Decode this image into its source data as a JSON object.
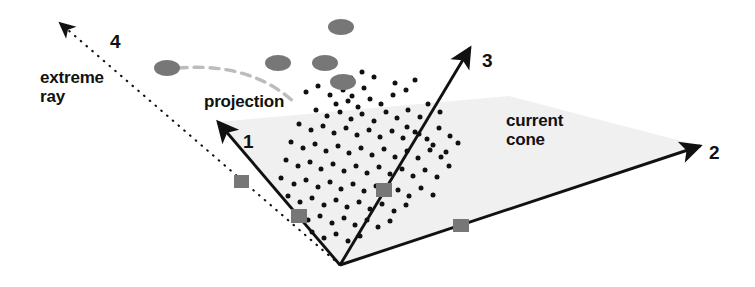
{
  "figure": {
    "name": "extreme-ray-projection-cone-diagram",
    "width": 755,
    "height": 287,
    "background_color": "#ffffff",
    "line_color": "#111111",
    "cone_fill_color": "#f0f0f0",
    "marker_gray_color": "#777777",
    "dashed_arc_color": "#bcbcbc",
    "dot_color": "#111111"
  },
  "labels": {
    "extreme_ray": "extreme\nray",
    "projection": "projection",
    "current_cone": "current\ncone",
    "axis_1": "1",
    "axis_2": "2",
    "axis_3": "3",
    "axis_4": "4"
  },
  "geometry": {
    "apex": [
      340,
      265
    ],
    "rays": [
      {
        "name": "ray-1",
        "label": "1",
        "style": "solid",
        "from": [
          340,
          265
        ],
        "to": [
          218,
          122
        ]
      },
      {
        "name": "ray-2",
        "label": "2",
        "style": "solid",
        "from": [
          340,
          265
        ],
        "to": [
          700,
          146
        ]
      },
      {
        "name": "ray-3",
        "label": "3",
        "style": "solid",
        "from": [
          340,
          265
        ],
        "to": [
          470,
          48
        ]
      },
      {
        "name": "ray-4-extreme",
        "label": "4",
        "style": "dotted",
        "from": [
          340,
          265
        ],
        "to": [
          60,
          23
        ]
      }
    ],
    "cone_polygon": [
      [
        340,
        265
      ],
      [
        218,
        122
      ],
      [
        509,
        96
      ],
      [
        700,
        146
      ]
    ],
    "projection_arc": {
      "from": [
        178,
        68
      ],
      "control": [
        252,
        62
      ],
      "to": [
        296,
        104
      ]
    }
  },
  "markers": {
    "ellipses": [
      {
        "cx": 167,
        "cy": 68,
        "rx": 13,
        "ry": 8
      },
      {
        "cx": 278,
        "cy": 63,
        "rx": 13,
        "ry": 8
      },
      {
        "cx": 325,
        "cy": 63,
        "rx": 13,
        "ry": 8
      },
      {
        "cx": 341,
        "cy": 27,
        "rx": 13,
        "ry": 8
      },
      {
        "cx": 343,
        "cy": 82,
        "rx": 13,
        "ry": 8
      }
    ],
    "squares": [
      {
        "x": 234,
        "y": 175,
        "w": 15,
        "h": 13
      },
      {
        "x": 291,
        "y": 209,
        "w": 16,
        "h": 14
      },
      {
        "x": 376,
        "y": 183,
        "w": 16,
        "h": 14
      },
      {
        "x": 453,
        "y": 219,
        "w": 16,
        "h": 13
      }
    ],
    "dots": [
      [
        306,
        92
      ],
      [
        318,
        86
      ],
      [
        330,
        95
      ],
      [
        343,
        90
      ],
      [
        352,
        96
      ],
      [
        364,
        88
      ],
      [
        336,
        104
      ],
      [
        348,
        101
      ],
      [
        358,
        107
      ],
      [
        370,
        99
      ],
      [
        381,
        104
      ],
      [
        393,
        95
      ],
      [
        316,
        110
      ],
      [
        327,
        116
      ],
      [
        340,
        112
      ],
      [
        351,
        119
      ],
      [
        362,
        114
      ],
      [
        374,
        121
      ],
      [
        386,
        112
      ],
      [
        397,
        118
      ],
      [
        408,
        110
      ],
      [
        420,
        117
      ],
      [
        299,
        124
      ],
      [
        311,
        130
      ],
      [
        323,
        126
      ],
      [
        334,
        133
      ],
      [
        346,
        128
      ],
      [
        357,
        135
      ],
      [
        369,
        130
      ],
      [
        380,
        137
      ],
      [
        392,
        131
      ],
      [
        403,
        138
      ],
      [
        415,
        132
      ],
      [
        427,
        139
      ],
      [
        439,
        128
      ],
      [
        450,
        136
      ],
      [
        291,
        142
      ],
      [
        303,
        148
      ],
      [
        315,
        144
      ],
      [
        326,
        151
      ],
      [
        338,
        146
      ],
      [
        349,
        153
      ],
      [
        361,
        148
      ],
      [
        372,
        155
      ],
      [
        384,
        149
      ],
      [
        395,
        157
      ],
      [
        407,
        151
      ],
      [
        418,
        158
      ],
      [
        430,
        150
      ],
      [
        441,
        157
      ],
      [
        286,
        160
      ],
      [
        298,
        166
      ],
      [
        310,
        162
      ],
      [
        321,
        169
      ],
      [
        333,
        164
      ],
      [
        344,
        171
      ],
      [
        356,
        166
      ],
      [
        367,
        173
      ],
      [
        379,
        167
      ],
      [
        390,
        174
      ],
      [
        402,
        169
      ],
      [
        413,
        176
      ],
      [
        425,
        170
      ],
      [
        437,
        177
      ],
      [
        449,
        166
      ],
      [
        281,
        178
      ],
      [
        294,
        184
      ],
      [
        306,
        180
      ],
      [
        318,
        187
      ],
      [
        330,
        182
      ],
      [
        341,
        189
      ],
      [
        353,
        184
      ],
      [
        364,
        191
      ],
      [
        376,
        186
      ],
      [
        398,
        190
      ],
      [
        409,
        196
      ],
      [
        421,
        188
      ],
      [
        433,
        195
      ],
      [
        288,
        196
      ],
      [
        300,
        202
      ],
      [
        312,
        198
      ],
      [
        324,
        205
      ],
      [
        336,
        200
      ],
      [
        347,
        207
      ],
      [
        359,
        202
      ],
      [
        370,
        209
      ],
      [
        382,
        204
      ],
      [
        394,
        211
      ],
      [
        406,
        205
      ],
      [
        296,
        214
      ],
      [
        308,
        220
      ],
      [
        320,
        216
      ],
      [
        332,
        223
      ],
      [
        344,
        218
      ],
      [
        355,
        225
      ],
      [
        367,
        220
      ],
      [
        378,
        227
      ],
      [
        390,
        221
      ],
      [
        312,
        232
      ],
      [
        324,
        238
      ],
      [
        336,
        234
      ],
      [
        348,
        241
      ],
      [
        360,
        236
      ],
      [
        433,
        145
      ],
      [
        446,
        152
      ],
      [
        458,
        143
      ],
      [
        407,
        127
      ],
      [
        419,
        134
      ],
      [
        395,
        83
      ],
      [
        406,
        90
      ],
      [
        415,
        80
      ],
      [
        428,
        104
      ],
      [
        440,
        112
      ],
      [
        351,
        78
      ],
      [
        362,
        72
      ],
      [
        374,
        77
      ]
    ]
  }
}
